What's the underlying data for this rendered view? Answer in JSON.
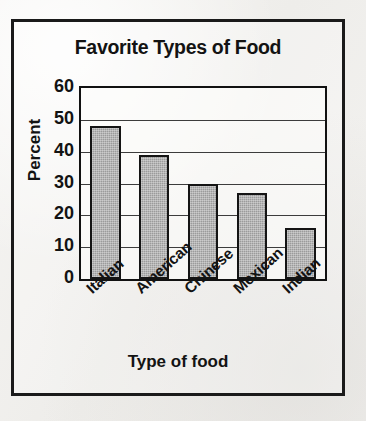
{
  "chart_data": {
    "type": "bar",
    "title": "Favorite Types of Food",
    "xlabel": "Type of food",
    "ylabel": "Percent",
    "categories": [
      "Italian",
      "American",
      "Chinese",
      "Mexican",
      "Indian"
    ],
    "values": [
      48,
      39,
      30,
      27,
      16
    ],
    "ylim": [
      0,
      60
    ],
    "ytick_labels": [
      "0",
      "10",
      "20",
      "30",
      "40",
      "50",
      "60"
    ],
    "ytick_values": [
      0,
      10,
      20,
      30,
      40,
      50,
      60
    ],
    "ytick_step": 10,
    "grid": "horizontal",
    "legend": "none",
    "bar_fill_color": "#9b9b9b",
    "bar_edge_color": "#141414",
    "gridline_color": "#3c3c3c",
    "text_color": "#131313",
    "background_color": "#f1f0ee",
    "xtick_rotation_degrees": -42
  }
}
